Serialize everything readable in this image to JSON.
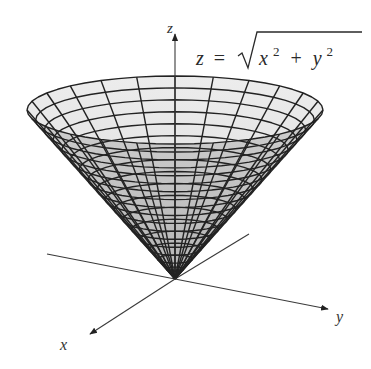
{
  "figure": {
    "equation": {
      "lhs": "z",
      "equals": "=",
      "radicand_x": "x",
      "radicand_plus": "+",
      "radicand_y": "y",
      "exponent": "2"
    },
    "axes": {
      "x_label": "x",
      "y_label": "y",
      "z_label": "z"
    },
    "colors": {
      "surface_fill_light": "#e9e9e9",
      "surface_fill_dark": "#bdbdbd",
      "mesh_line": "#222222",
      "axis_line": "#3a3a3a",
      "background": "#ffffff"
    },
    "surface": {
      "type": "cone",
      "radial_divisions": 24,
      "height_rings_outer": 5,
      "height_rings_inner": 12
    }
  }
}
